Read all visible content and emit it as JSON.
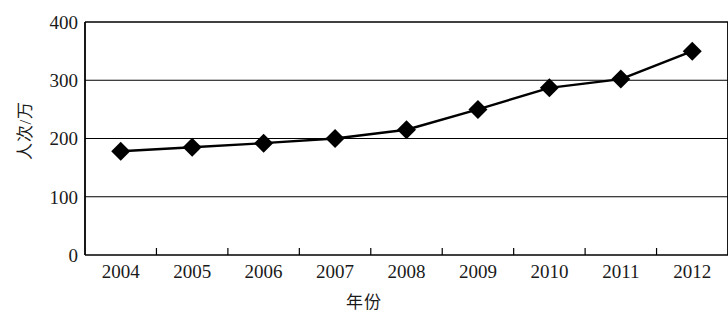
{
  "chart_data": {
    "type": "line",
    "title": "",
    "subtitle": "",
    "xlabel": "年份",
    "ylabel": "人次/万",
    "categories": [
      "2004",
      "2005",
      "2006",
      "2007",
      "2008",
      "2009",
      "2010",
      "2011",
      "2012"
    ],
    "values": [
      178,
      185,
      192,
      200,
      215,
      250,
      287,
      302,
      350
    ],
    "series": [
      {
        "name": "人次/万",
        "values": [
          178,
          185,
          192,
          200,
          215,
          250,
          287,
          302,
          350
        ]
      }
    ],
    "ylim": [
      0,
      400
    ],
    "yticks": [
      0,
      100,
      200,
      300,
      400
    ],
    "ytick_labels": [
      "0",
      "100",
      "200",
      "300",
      "400"
    ],
    "grid": "horizontal",
    "legend": "none",
    "marker": "diamond",
    "line_color": "#000000",
    "marker_color": "#000000",
    "grid_color": "#000000",
    "background_color": "#ffffff"
  }
}
